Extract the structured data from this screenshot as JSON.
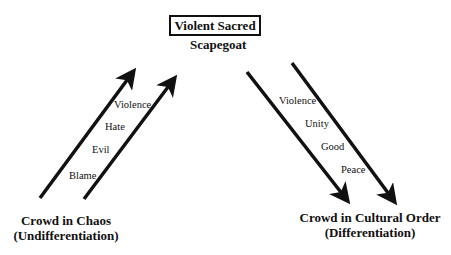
{
  "diagram": {
    "title": "Violent Sacred",
    "subtitle": "Scapegoat",
    "left": {
      "label_line1": "Crowd in Chaos",
      "label_line2": "(Undifferentiation)",
      "direction": "up",
      "words": [
        "Violence",
        "Hate",
        "Evil",
        "Blame"
      ]
    },
    "right": {
      "label_line1": "Crowd in Cultural Order",
      "label_line2": "(Differentiation)",
      "direction": "down",
      "words": [
        "Violence",
        "Unity",
        "Good",
        "Peace"
      ]
    },
    "colors": {
      "ink": "#111111",
      "background": "#ffffff"
    }
  }
}
